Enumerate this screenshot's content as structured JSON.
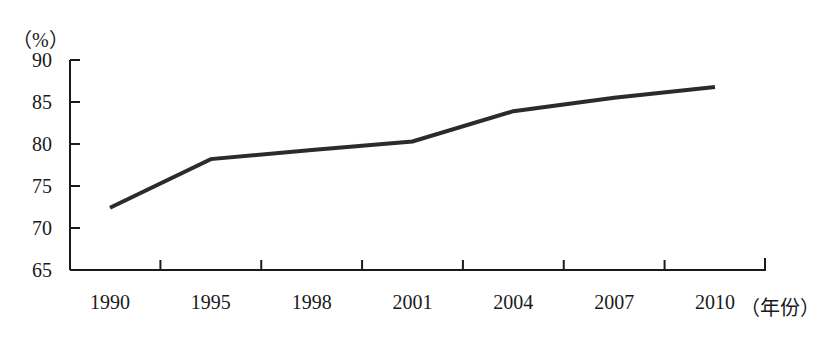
{
  "chart_data": {
    "type": "line",
    "title": "",
    "xlabel": "（年份）",
    "ylabel": "（%）",
    "categories": [
      "1990",
      "1995",
      "1998",
      "2001",
      "2004",
      "2007",
      "2010"
    ],
    "values": [
      72.4,
      78.2,
      79.3,
      80.3,
      83.9,
      85.5,
      86.8
    ],
    "series": [
      {
        "name": "",
        "values": [
          72.4,
          78.2,
          79.3,
          80.3,
          83.9,
          85.5,
          86.8
        ]
      }
    ],
    "ylim": [
      65,
      90
    ],
    "yticks": [
      65,
      70,
      75,
      80,
      85,
      90
    ],
    "ytick_labels": [
      "65",
      "70",
      "75",
      "80",
      "85",
      "90"
    ],
    "grid": false,
    "legend": "none",
    "line_color": "#2b2b2b",
    "axis_color": "#1a1a1a"
  },
  "axis": {
    "unit_label": "（%）",
    "x_title": "（年份）"
  }
}
